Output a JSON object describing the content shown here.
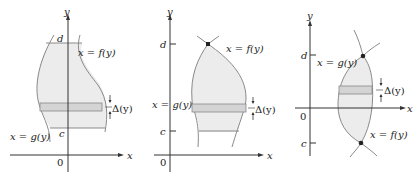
{
  "figures": [
    {
      "id": "panel-1",
      "axis_x": "x",
      "axis_y": "y",
      "origin": "0",
      "y_lower": "c",
      "y_upper": "d",
      "right_curve": "x = f(y)",
      "left_curve": "x = g(y)",
      "strip_label": "Δ(y)"
    },
    {
      "id": "panel-2",
      "axis_x": "x",
      "axis_y": "y",
      "origin": "0",
      "y_lower": "c",
      "y_upper": "d",
      "right_curve": "x = f(y)",
      "left_curve": "x = g(y)",
      "strip_label": "Δ(y)"
    },
    {
      "id": "panel-3",
      "axis_x": "x",
      "axis_y": "y",
      "origin": "0",
      "y_lower": "c",
      "y_upper": "d",
      "right_curve": "x = f(y)",
      "left_curve": "x = g(y)",
      "strip_label": "Δ(y)"
    }
  ],
  "colors": {
    "region_fill": "#ececec",
    "strip_fill": "#d4d4d4",
    "curve": "#8a8a8a",
    "axis": "#333333",
    "point": "#222222"
  }
}
